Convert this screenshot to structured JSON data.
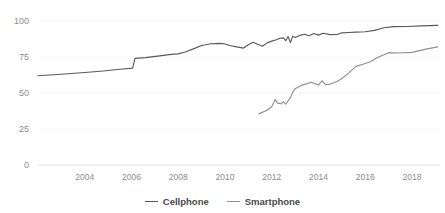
{
  "chart_data": {
    "type": "line",
    "title": "",
    "xlabel": "",
    "ylabel": "",
    "xlim": [
      2002.0,
      2019.2
    ],
    "ylim": [
      0,
      100
    ],
    "grid": true,
    "legend_position": "bottom-center",
    "xticks": [
      "2004",
      "2006",
      "2008",
      "2010",
      "2012",
      "2014",
      "2016",
      "2018"
    ],
    "xtick_values": [
      2004,
      2006,
      2008,
      2010,
      2012,
      2014,
      2016,
      2018
    ],
    "yticks": [
      "0",
      "25",
      "50",
      "75",
      "100"
    ],
    "ytick_values": [
      0,
      25,
      50,
      75,
      100
    ],
    "colors": {
      "cellphone": "#595959",
      "smartphone": "#8f8f8f",
      "axis_text": "#8c8c8c",
      "gridline": "#f4f4f4",
      "axis_line": "#e6e6e6",
      "background": "#ffffff"
    },
    "series": [
      {
        "name": "Cellphone",
        "color": "#595959",
        "x": [
          2002.0,
          2003.0,
          2004.0,
          2004.8,
          2005.5,
          2006.05,
          2006.15,
          2006.6,
          2007.2,
          2007.8,
          2008.0,
          2008.3,
          2008.7,
          2009.0,
          2009.4,
          2009.8,
          2010.0,
          2010.2,
          2010.5,
          2010.8,
          2011.0,
          2011.2,
          2011.4,
          2011.6,
          2011.8,
          2012.0,
          2012.2,
          2012.35,
          2012.5,
          2012.6,
          2012.7,
          2012.8,
          2012.9,
          2013.0,
          2013.2,
          2013.4,
          2013.6,
          2013.8,
          2014.0,
          2014.2,
          2014.5,
          2014.8,
          2015.0,
          2015.3,
          2015.6,
          2016.0,
          2016.4,
          2016.8,
          2017.2,
          2017.8,
          2018.4,
          2019.1
        ],
        "y": [
          62.0,
          63.0,
          64.2,
          65.3,
          66.5,
          67.3,
          74.0,
          74.6,
          75.8,
          77.0,
          77.2,
          78.5,
          81.0,
          83.0,
          84.2,
          84.5,
          84.0,
          83.0,
          82.0,
          81.2,
          83.5,
          85.2,
          83.8,
          82.5,
          84.8,
          86.0,
          87.0,
          88.0,
          88.3,
          86.3,
          89.3,
          85.0,
          89.5,
          88.5,
          90.0,
          90.8,
          89.8,
          91.3,
          90.2,
          91.5,
          90.5,
          90.6,
          91.8,
          92.0,
          92.3,
          92.5,
          93.5,
          95.3,
          96.1,
          96.2,
          96.6,
          97.0
        ]
      },
      {
        "name": "Smartphone",
        "color": "#8f8f8f",
        "x": [
          2011.45,
          2011.8,
          2012.0,
          2012.15,
          2012.25,
          2012.4,
          2012.5,
          2012.6,
          2012.7,
          2012.8,
          2012.9,
          2013.0,
          2013.3,
          2013.7,
          2014.0,
          2014.15,
          2014.3,
          2014.5,
          2014.8,
          2015.0,
          2015.3,
          2015.6,
          2015.9,
          2016.2,
          2016.5,
          2016.8,
          2017.0,
          2017.4,
          2018.0,
          2018.6,
          2019.1
        ],
        "y": [
          35.5,
          38.0,
          40.5,
          45.5,
          43.0,
          42.5,
          44.0,
          42.2,
          44.5,
          46.8,
          50.5,
          53.0,
          55.5,
          57.5,
          55.5,
          58.5,
          55.8,
          56.2,
          58.0,
          60.0,
          64.0,
          68.5,
          70.0,
          71.5,
          74.5,
          76.5,
          78.0,
          77.8,
          78.2,
          80.5,
          82.0
        ]
      }
    ],
    "legend": [
      {
        "label": "Cellphone",
        "color": "#595959"
      },
      {
        "label": "Smartphone",
        "color": "#8f8f8f"
      }
    ]
  }
}
